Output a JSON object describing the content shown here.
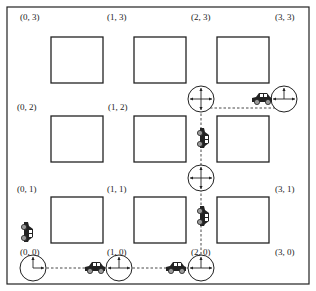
{
  "diagram": {
    "colors": {
      "stroke": "#222222",
      "background": "#ffffff",
      "car": "#222222"
    },
    "node_labels": [
      {
        "id": "0,3",
        "label": "(0, 3)"
      },
      {
        "id": "1,3",
        "label": "(1, 3)"
      },
      {
        "id": "2,3",
        "label": "(2, 3)"
      },
      {
        "id": "3,3",
        "label": "(3, 3)"
      },
      {
        "id": "0,2",
        "label": "(0, 2)"
      },
      {
        "id": "1,2",
        "label": "(1, 2)"
      },
      {
        "id": "0,1",
        "label": "(0, 1)"
      },
      {
        "id": "1,1",
        "label": "(1, 1)"
      },
      {
        "id": "3,1",
        "label": "(3, 1)"
      },
      {
        "id": "0,0",
        "label": "(0, 0)"
      },
      {
        "id": "1,0",
        "label": "(1, 0)"
      },
      {
        "id": "2,0",
        "label": "(2, 0)"
      },
      {
        "id": "3,0",
        "label": "(3, 0)"
      }
    ],
    "intersections": [
      {
        "node": "0,0",
        "arrows": [
          "up",
          "right"
        ]
      },
      {
        "node": "1,0",
        "arrows": [
          "up",
          "left",
          "right"
        ]
      },
      {
        "node": "2,0",
        "arrows": [
          "up",
          "left",
          "right"
        ]
      },
      {
        "node": "2,1",
        "arrows": [
          "up",
          "down",
          "left",
          "right"
        ]
      },
      {
        "node": "2,2",
        "arrows": [
          "up",
          "down",
          "left",
          "right"
        ]
      },
      {
        "node": "3,2",
        "arrows": [
          "up",
          "left",
          "right"
        ]
      }
    ],
    "route": [
      "0,0",
      "1,0",
      "2,0",
      "2,1",
      "2,2",
      "3,2"
    ],
    "cars": [
      {
        "orientation": "vertical",
        "segment": "0,0 approach"
      },
      {
        "orientation": "horizontal",
        "segment": "0,0-1,0"
      },
      {
        "orientation": "horizontal",
        "segment": "1,0-2,0"
      },
      {
        "orientation": "vertical",
        "segment": "2,0-2,1"
      },
      {
        "orientation": "vertical",
        "segment": "2,1-2,2"
      },
      {
        "orientation": "horizontal",
        "segment": "2,2-3,2"
      }
    ]
  }
}
